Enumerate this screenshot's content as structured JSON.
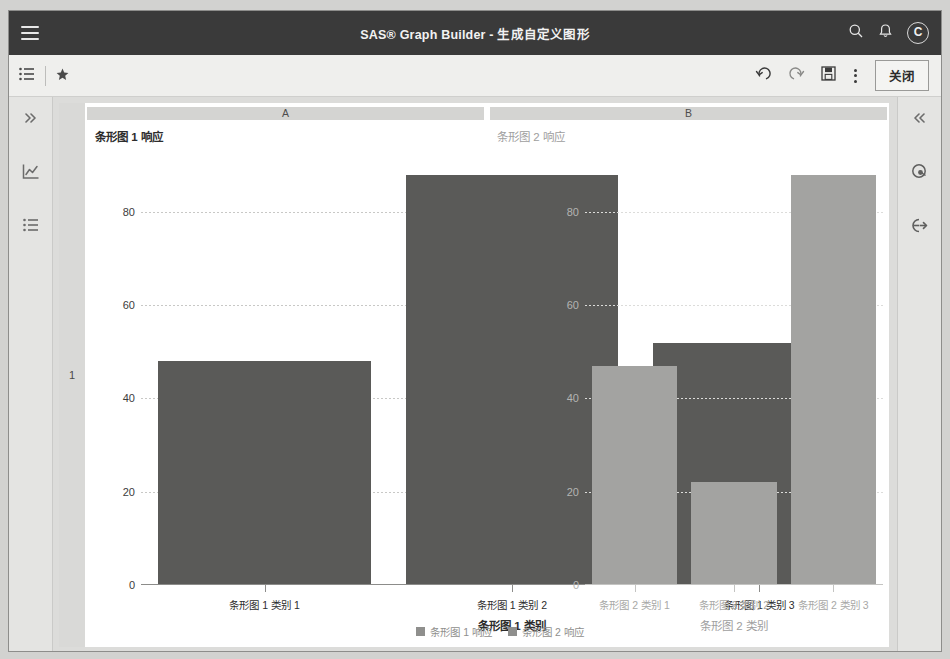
{
  "app": {
    "title": "SAS® Graph Builder - 生成自定义图形",
    "menu_icon": "hamburger-icon",
    "search_icon": "search-icon",
    "notifications_icon": "bell-icon",
    "avatar_initial": "C"
  },
  "toolbar": {
    "list_icon": "list-icon",
    "star_icon": "star-icon",
    "undo_icon": "undo-icon",
    "redo_icon": "redo-icon",
    "save_icon": "save-icon",
    "more_icon": "more-vertical-icon",
    "close_label": "关闭"
  },
  "left_rail": {
    "items": [
      {
        "name": "expand-panel",
        "icon": "chevron-double-right-icon"
      },
      {
        "name": "graph-gallery",
        "icon": "chart-icon"
      },
      {
        "name": "data-list",
        "icon": "list-icon"
      }
    ]
  },
  "right_rail": {
    "items": [
      {
        "name": "collapse-panel",
        "icon": "chevron-double-left-icon"
      },
      {
        "name": "roles",
        "icon": "roles-icon"
      },
      {
        "name": "data-export",
        "icon": "data-export-icon"
      }
    ]
  },
  "canvas": {
    "row_header": "1",
    "column_headers": [
      "A",
      "B"
    ]
  },
  "chart_data": {
    "type": "bar",
    "title": "",
    "panels": [
      {
        "panel_label": "A",
        "ylabel": "条形图 1 响应",
        "xlabel": "条形图 1 类别",
        "categories": [
          "条形图 1 类别 1",
          "条形图 1 类别 2",
          "条形图 1 类别 3"
        ],
        "values": [
          48,
          88,
          52
        ],
        "ylim": [
          0,
          92
        ],
        "yticks": [
          0,
          20,
          40,
          60,
          80
        ],
        "color": "#5a5a58",
        "grid": true
      },
      {
        "panel_label": "B",
        "ylabel": "条形图 2 响应",
        "xlabel": "条形图 2 类别",
        "categories": [
          "条形图 2 类别 1",
          "条形图 2 类别 2",
          "条形图 2 类别 3"
        ],
        "values": [
          47,
          22,
          88
        ],
        "ylim": [
          0,
          92
        ],
        "yticks": [
          0,
          20,
          40,
          60,
          80
        ],
        "color": "#a3a3a1",
        "grid": true
      }
    ],
    "legend": {
      "position": "bottom",
      "entries": [
        {
          "label": "条形图 1 响应",
          "color": "#8f8f8d"
        },
        {
          "label": "条形图 2 响应",
          "color": "#8f8f8d"
        }
      ]
    }
  }
}
